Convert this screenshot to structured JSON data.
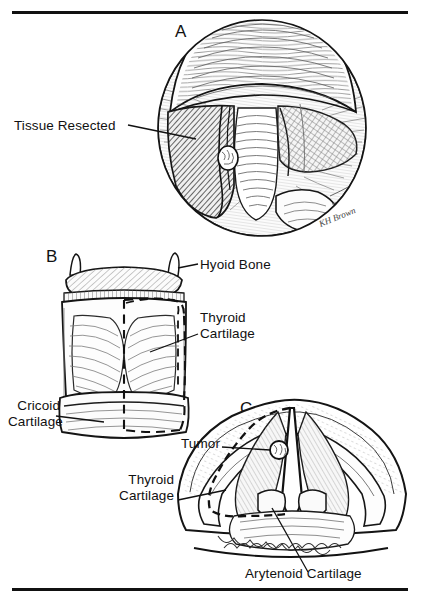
{
  "figure": {
    "background_color": "#ffffff",
    "ink_color": "#111111",
    "rule_top": "horizontal-rule",
    "rule_bottom": "horizontal-rule"
  },
  "panels": [
    {
      "id": "A",
      "letter": "A",
      "view": "laryngoscopic view of the larynx showing hatched tissue-resection area over the left vocal cord and false cord with a small tumor nodule",
      "labels": [
        {
          "name": "tissue-resected",
          "text": "Tissue Resected"
        }
      ],
      "signature": "KH Brown"
    },
    {
      "id": "B",
      "letter": "B",
      "view": "anterior view of the laryngeal skeleton with dashed resection outline over the right hemilarynx",
      "labels": [
        {
          "name": "hyoid-bone",
          "text": "Hyoid Bone"
        },
        {
          "name": "thyroid-cartilage",
          "text": "Thyroid\nCartilage"
        },
        {
          "name": "cricoid-cartilage",
          "text": "Cricoid\nCartilage"
        }
      ]
    },
    {
      "id": "C",
      "letter": "C",
      "view": "axial cross-section of the larynx at the glottic level with dashed resection margin and tumor",
      "labels": [
        {
          "name": "tumor",
          "text": "Tumor"
        },
        {
          "name": "thyroid-cartilage",
          "text": "Thyroid\nCartilage"
        },
        {
          "name": "arytenoid-cartilage",
          "text": "Arytenoid Cartilage"
        }
      ]
    }
  ]
}
